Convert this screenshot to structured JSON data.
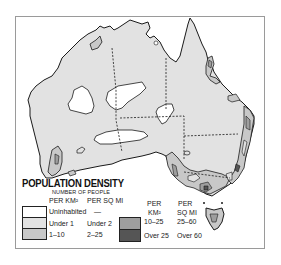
{
  "map": {
    "title": "Australia population density",
    "colors": {
      "uninhabited": "#ffffff",
      "under1": "#e2e2e2",
      "1_10": "#c8c8c8",
      "10_25": "#9e9e9e",
      "over25": "#555555",
      "outline": "#1a1a1a",
      "frame": "#9a9a9a"
    }
  },
  "legend": {
    "title": "POPULATION DENSITY",
    "subtitle": "NUMBER OF PEOPLE",
    "col_km2": "PER KM²",
    "col_sqmi": "PER SQ MI",
    "col_per_a": "PER",
    "col_km2_b": "KM²",
    "col_per_b": "PER",
    "col_sqmi_b": "SQ MI",
    "items": [
      {
        "km2": "Uninhabited",
        "sqmi": "—",
        "color": "#ffffff"
      },
      {
        "km2": "Under 1",
        "sqmi": "Under 2",
        "color": "#e2e2e2"
      },
      {
        "km2": "1–10",
        "sqmi": "2–25",
        "color": "#c8c8c8"
      },
      {
        "km2": "10–25",
        "sqmi": "25–60",
        "color": "#9e9e9e"
      },
      {
        "km2": "Over 25",
        "sqmi": "Over 60",
        "color": "#555555"
      }
    ]
  }
}
